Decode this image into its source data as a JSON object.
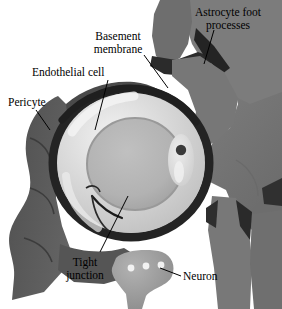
{
  "figure": {
    "width": 282,
    "height": 309,
    "background": "#ffffff"
  },
  "labels": {
    "astrocyte": "Astrocyte foot\nprocesses",
    "basement": "Basement\nmembrane",
    "endothelial": "Endothelial cell",
    "pericyte": "Pericyte",
    "tight_junction": "Tight\njunction",
    "neuron": "Neuron"
  },
  "colors": {
    "background": "#ffffff",
    "astrocyte_body": "#7a7a7a",
    "astrocyte_dark": "#2e2e2e",
    "astrocyte_mid": "#6a6a6a",
    "pericyte": "#585858",
    "pericyte_dark": "#3d3d3d",
    "basement_membrane": "#262626",
    "endothelial_light": "#d8d8d8",
    "endothelial_highlight": "#efefef",
    "lumen": "#b4b4b4",
    "lumen_edge": "#9e9e9e",
    "neuron_body": "#9a9a9a",
    "neuron_dot": "#f2f2f2",
    "nucleus": "#3a3a3a",
    "leader_line": "#000000",
    "text": "#000000"
  },
  "structures": [
    {
      "name": "astrocyte-foot-processes",
      "description": "Dark gray astrocyte cell mass with foot processes wrapping the capillary from above and right"
    },
    {
      "name": "basement-membrane",
      "description": "Thin dark band surrounding the endothelial cell ring"
    },
    {
      "name": "endothelial-cell",
      "description": "Light gray annulus forming the capillary wall"
    },
    {
      "name": "capillary-lumen",
      "description": "Medium gray central oval, the vessel lumen"
    },
    {
      "name": "pericyte",
      "description": "Dark gray scalloped cell on the left wrapping the vessel"
    },
    {
      "name": "tight-junction",
      "description": "Dark seam in the endothelial ring at lower left where cell edges meet"
    },
    {
      "name": "endothelial-nucleus",
      "description": "Dark round nucleus in the elongated cell at the right of the ring"
    },
    {
      "name": "neuron",
      "description": "Gray flask-shaped cell body below the capillary with three pale vesicles"
    }
  ]
}
